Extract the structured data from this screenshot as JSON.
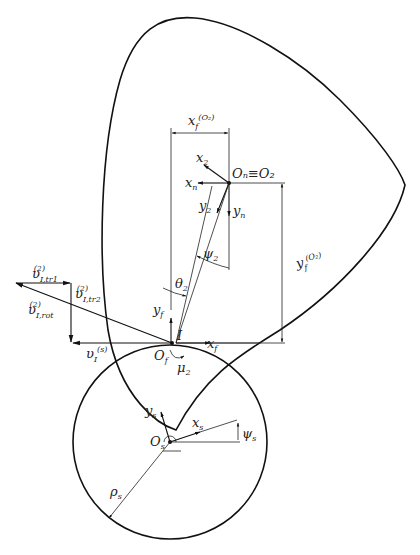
{
  "figure": {
    "labels": {
      "x_f_O2": {
        "base": "x",
        "sub": "f",
        "sup": "(O₂)"
      },
      "y_f_O2": {
        "base": "y",
        "sub": "f",
        "sup": "(O₂)"
      },
      "O_n_O2": "Oₙ≡O₂",
      "x_2": {
        "base": "x",
        "sub": "2"
      },
      "x_n": {
        "base": "x",
        "sub": "n"
      },
      "y_2": {
        "base": "y",
        "sub": "2"
      },
      "y_n": {
        "base": "y",
        "sub": "n"
      },
      "psi_2": {
        "base": "ψ",
        "sub": "2"
      },
      "theta_2": {
        "base": "θ",
        "sub": "2"
      },
      "y_f": {
        "base": "y",
        "sub": "f"
      },
      "x_f": {
        "base": "x",
        "sub": "f"
      },
      "I": "I",
      "O_f": {
        "base": "O",
        "sub": "f"
      },
      "mu_2": {
        "base": "μ",
        "sub": "2"
      },
      "v_tr1": {
        "base": "υ",
        "sub": "I,tr1",
        "sup": "(2)"
      },
      "v_tr2": {
        "base": "υ",
        "sub": "I,tr2",
        "sup": "(2)"
      },
      "v_rot": {
        "base": "υ",
        "sub": "I,rot",
        "sup": "(2)"
      },
      "v_s": {
        "base": "υ",
        "sub": "I",
        "sup": "(s)"
      },
      "y_s": {
        "base": "y",
        "sub": "s"
      },
      "x_s": {
        "base": "x",
        "sub": "s"
      },
      "O_s": {
        "base": "O",
        "sub": "s"
      },
      "psi_s": {
        "base": "ψ",
        "sub": "s"
      },
      "rho_s": {
        "base": "ρ",
        "sub": "s"
      }
    },
    "caption": ""
  }
}
